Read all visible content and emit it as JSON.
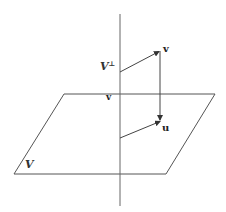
{
  "diagram": {
    "labels": {
      "subspace": "V",
      "orthogonal_complement": "V",
      "orthogonal_superscript": "⊥",
      "vector_v": "v",
      "origin_label": "v",
      "projection_u": "u"
    },
    "colors": {
      "lines": "#555555",
      "text": "#333333",
      "background": "#ffffff"
    },
    "geometry": {
      "plane": [
        [
          64,
          94
        ],
        [
          215,
          94
        ],
        [
          166,
          174
        ],
        [
          14,
          174
        ]
      ],
      "axis": {
        "x": 120,
        "y1": 14,
        "y2": 206
      },
      "arrow_to_v": {
        "from": [
          120,
          72
        ],
        "to": [
          160,
          51
        ]
      },
      "v_to_u": {
        "from": [
          160,
          51
        ],
        "to": [
          160,
          121
        ]
      },
      "arrow_to_u": {
        "from": [
          120,
          138
        ],
        "to": [
          161,
          121
        ]
      }
    }
  }
}
